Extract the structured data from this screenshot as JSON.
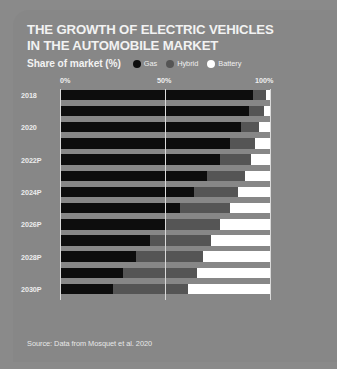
{
  "card": {
    "title": "THE GROWTH OF ELECTRIC VEHICLES IN THE AUTOMOBILE MARKET",
    "subtitle": "Share of market (%)",
    "source": "Source: Data from Mosquet et al. 2020",
    "background_color": "#878787",
    "page_background_color": "#8a8a8a"
  },
  "legend": {
    "position": "top",
    "items": [
      {
        "label": "Gas",
        "color": "#0d0d0d"
      },
      {
        "label": "Hybrid",
        "color": "#555555"
      },
      {
        "label": "Battery",
        "color": "#ffffff"
      }
    ]
  },
  "chart_data": {
    "type": "bar",
    "orientation": "horizontal",
    "stacked": true,
    "title": "THE GROWTH OF ELECTRIC VEHICLES IN THE AUTOMOBILE MARKET",
    "subtitle": "Share of market (%)",
    "xlabel": "",
    "ylabel": "",
    "xlim": [
      0,
      100
    ],
    "xticks": [
      0,
      50,
      100
    ],
    "xticklabels": [
      "0%",
      "50%",
      "100%"
    ],
    "grid": true,
    "legend_position": "top",
    "categories": [
      "2018",
      "2019",
      "2020",
      "2021",
      "2022P",
      "2023P",
      "2024P",
      "2025P",
      "2026P",
      "2027P",
      "2028P",
      "2029P",
      "2030P"
    ],
    "tick_labels_shown": [
      "2018",
      "2020",
      "2022P",
      "2024P",
      "2026P",
      "2028P",
      "2030P"
    ],
    "series": [
      {
        "name": "Gas",
        "color": "#0d0d0d",
        "values": [
          92,
          90,
          86,
          81,
          76,
          70,
          64,
          57,
          50,
          43,
          36,
          30,
          25
        ]
      },
      {
        "name": "Hybrid",
        "color": "#555555",
        "values": [
          6,
          7,
          9,
          12,
          15,
          18,
          21,
          24,
          26,
          29,
          32,
          35,
          36
        ]
      },
      {
        "name": "Battery",
        "color": "#ffffff",
        "values": [
          2,
          3,
          5,
          7,
          9,
          12,
          15,
          19,
          24,
          28,
          32,
          35,
          39
        ]
      }
    ]
  }
}
